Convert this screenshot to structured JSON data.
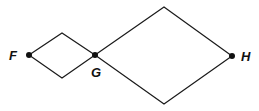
{
  "diagram": {
    "type": "graph",
    "nodes": [
      {
        "id": "F",
        "label": "F",
        "x": 29,
        "y": 55,
        "lx": 9,
        "ly": 60,
        "anchor": "start"
      },
      {
        "id": "G",
        "label": "G",
        "x": 95,
        "y": 55,
        "lx": 91,
        "ly": 77,
        "anchor": "start"
      },
      {
        "id": "H",
        "label": "H",
        "x": 232,
        "y": 56,
        "lx": 241,
        "ly": 61,
        "anchor": "start"
      }
    ],
    "edges": [
      {
        "from": "F",
        "to": "G",
        "via": [
          62,
          33
        ]
      },
      {
        "from": "F",
        "to": "G",
        "via": [
          62,
          78
        ]
      },
      {
        "from": "G",
        "to": "H",
        "via": [
          164,
          7
        ]
      },
      {
        "from": "G",
        "to": "H",
        "via": [
          164,
          104
        ]
      }
    ],
    "colors": {
      "line": "#1a1a1a",
      "node": "#111111"
    }
  }
}
